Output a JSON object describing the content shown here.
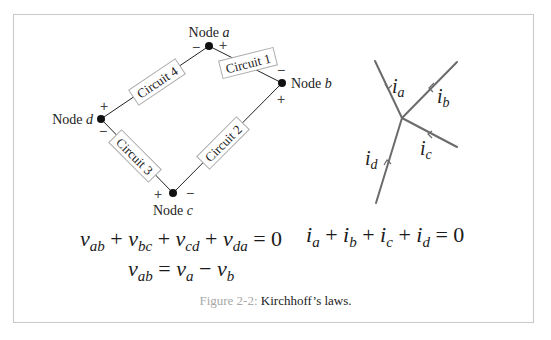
{
  "figure": {
    "label": "Figure 2-2:",
    "caption": "Kirchhoff’s laws."
  },
  "loop_diagram": {
    "nodes": [
      {
        "id": "a",
        "label": "Node",
        "var": "a",
        "x": 209,
        "y": 46
      },
      {
        "id": "b",
        "label": "Node",
        "var": "b",
        "x": 282,
        "y": 83
      },
      {
        "id": "c",
        "label": "Node",
        "var": "c",
        "x": 173,
        "y": 193
      },
      {
        "id": "d",
        "label": "Node",
        "var": "d",
        "x": 101,
        "y": 119
      }
    ],
    "circuits": [
      {
        "label": "Circuit 1",
        "from": "a",
        "to": "b"
      },
      {
        "label": "Circuit 2",
        "from": "b",
        "to": "c"
      },
      {
        "label": "Circuit 3",
        "from": "c",
        "to": "d"
      },
      {
        "label": "Circuit 4",
        "from": "d",
        "to": "a"
      }
    ],
    "polarity": {
      "plus": "+",
      "minus": "−"
    }
  },
  "junction_diagram": {
    "currents": [
      {
        "name": "i",
        "sub": "a"
      },
      {
        "name": "i",
        "sub": "b"
      },
      {
        "name": "i",
        "sub": "c"
      },
      {
        "name": "i",
        "sub": "d"
      }
    ],
    "line_color": "#6b6b6b"
  },
  "equations": {
    "kvl": {
      "terms": [
        {
          "v": "v",
          "sub": "ab"
        },
        {
          "v": "v",
          "sub": "bc"
        },
        {
          "v": "v",
          "sub": "cd"
        },
        {
          "v": "v",
          "sub": "da"
        }
      ],
      "plus": "+",
      "rhs": "= 0"
    },
    "vab": {
      "lhs_v": "v",
      "lhs_sub": "ab",
      "eq": "=",
      "a_v": "v",
      "a_sub": "a",
      "minus": "−",
      "b_v": "v",
      "b_sub": "b"
    },
    "kcl": {
      "terms": [
        {
          "v": "i",
          "sub": "a"
        },
        {
          "v": "i",
          "sub": "b"
        },
        {
          "v": "i",
          "sub": "c"
        },
        {
          "v": "i",
          "sub": "d"
        }
      ],
      "plus": "+",
      "rhs": "= 0"
    }
  }
}
